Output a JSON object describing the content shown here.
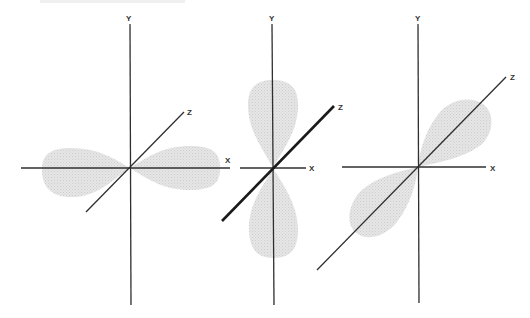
{
  "figure": {
    "type": "p-orbital diagrams",
    "colors": {
      "axis": "#2f2f2f",
      "lobe_fill": "#e3e3e3",
      "lobe_dots": "#cfcfcf",
      "background": "#ffffff"
    },
    "panels": [
      {
        "name": "px-orbital",
        "orientation": "lobes along X axis",
        "labels": {
          "y": "Y",
          "x": "X",
          "z": "Z"
        },
        "bold_axis": "none"
      },
      {
        "name": "py-orbital",
        "orientation": "lobes along Y axis",
        "labels": {
          "y": "Y",
          "x": "X",
          "z": "Z"
        },
        "bold_axis": "Z"
      },
      {
        "name": "pz-orbital",
        "orientation": "lobes along Z axis",
        "labels": {
          "y": "Y",
          "x": "X",
          "z": "Z"
        },
        "bold_axis": "none"
      }
    ]
  }
}
